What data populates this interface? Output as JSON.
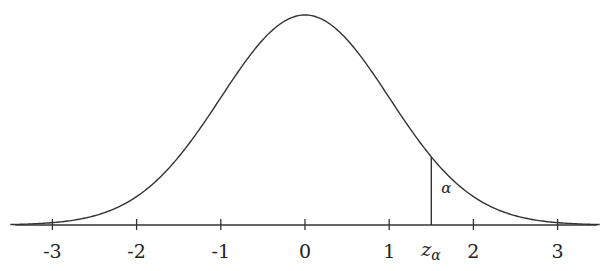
{
  "chart_data": {
    "type": "line",
    "title": "",
    "xlabel": "",
    "ylabel": "",
    "function": "standard normal pdf",
    "xlim": [
      -3.5,
      3.5
    ],
    "ylim": [
      0,
      0.4
    ],
    "grid": false,
    "x_ticks": [
      -3,
      -2,
      -1,
      0,
      1,
      2,
      3
    ],
    "x_tick_labels": [
      "-3",
      "-2",
      "-1",
      "0",
      "1",
      "2",
      "3"
    ],
    "critical_value": {
      "x": 1.5,
      "label_main": "z",
      "label_sub": "α"
    },
    "tail_area_label": "α",
    "line_color": "#333333"
  }
}
